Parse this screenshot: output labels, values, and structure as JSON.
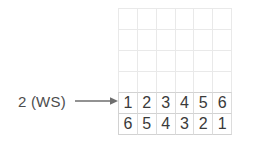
{
  "diagram": {
    "annotation": {
      "label": "2 (WS)",
      "arrow_icon": "arrow-right-icon"
    },
    "grid": {
      "rows": 6,
      "columns": 6,
      "gridline_color": "#e9e9e9",
      "filled_gridline_color": "#d2d2d2",
      "text_color": "#3a3a3a",
      "cells": [
        [
          "",
          "",
          "",
          "",
          "",
          ""
        ],
        [
          "",
          "",
          "",
          "",
          "",
          ""
        ],
        [
          "",
          "",
          "",
          "",
          "",
          ""
        ],
        [
          "",
          "",
          "",
          "",
          "",
          ""
        ],
        [
          "1",
          "2",
          "3",
          "4",
          "5",
          "6"
        ],
        [
          "6",
          "5",
          "4",
          "3",
          "2",
          "1"
        ]
      ]
    }
  }
}
